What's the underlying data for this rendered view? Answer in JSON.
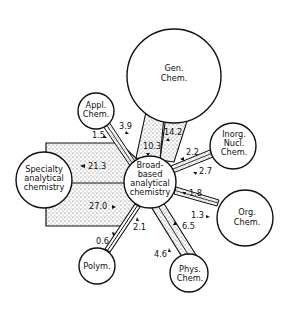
{
  "diagram": {
    "type": "citation-flow network",
    "nodes": {
      "gen_chem": {
        "lines": [
          "Gen.",
          "Chem."
        ]
      },
      "appl_chem": {
        "lines": [
          "Appl.",
          "Chem."
        ]
      },
      "inorg_nucl_chem": {
        "lines": [
          "Inorg.",
          "Nucl.",
          "Chem."
        ]
      },
      "broad_based": {
        "lines": [
          "Broad-",
          "based",
          "analytical",
          "chemistry"
        ]
      },
      "specialty": {
        "lines": [
          "Specialty",
          "analytical",
          "chemistry"
        ]
      },
      "org_chem": {
        "lines": [
          "Org.",
          "Chem."
        ]
      },
      "polym": {
        "lines": [
          "Polym."
        ]
      },
      "phys_chem": {
        "lines": [
          "Phys.",
          "Chem."
        ]
      }
    },
    "flows": {
      "gen_to_broad": "10.3",
      "broad_to_gen": "14.2",
      "appl_to_broad": "3.9",
      "broad_to_appl": "1.5",
      "inorg_to_broad": "2.2",
      "broad_to_inorg": "2.7",
      "specialty_to_broad": "21.3",
      "broad_to_specialty": "27.0",
      "org_to_broad": "1.8",
      "broad_to_org": "1.3",
      "polym_to_broad": "2.1",
      "broad_to_polym": "0.6",
      "phys_to_broad": "6.5",
      "broad_to_phys": "4.6"
    },
    "colors": {
      "line": "#111111",
      "fill": "#ffffff",
      "stipple": "#9a9a9a"
    }
  }
}
